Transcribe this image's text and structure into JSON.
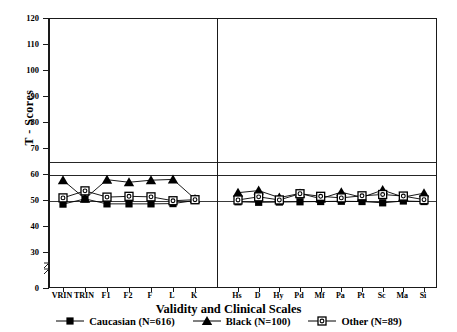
{
  "chart_data": {
    "type": "line",
    "title": "",
    "xlabel": "Validity and Clinical Scales",
    "ylabel": "T - Scores",
    "ylim": [
      0,
      120
    ],
    "yticks": [
      0,
      30,
      40,
      50,
      60,
      70,
      80,
      90,
      100,
      110,
      120
    ],
    "y_axis_break_between": [
      0,
      30
    ],
    "grid": false,
    "reference_lines": [
      65,
      60,
      50
    ],
    "group_divider_after_category": "K",
    "categories": [
      "VRIN",
      "TRIN",
      "F1",
      "F2",
      "F",
      "L",
      "K",
      "Hs",
      "D",
      "Hy",
      "Pd",
      "Mf",
      "Pa",
      "Pt",
      "Sc",
      "Ma",
      "Si"
    ],
    "category_groups": [
      {
        "name": "Validity Scales",
        "categories": [
          "VRIN",
          "TRIN",
          "F1",
          "F2",
          "F",
          "L",
          "K"
        ]
      },
      {
        "name": "Clinical Scales",
        "categories": [
          "Hs",
          "D",
          "Hy",
          "Pd",
          "Mf",
          "Pa",
          "Pt",
          "Sc",
          "Ma",
          "Si"
        ]
      }
    ],
    "legend_position": "bottom",
    "series": [
      {
        "name": "Caucasian (N=616)",
        "marker": "filled-square",
        "color": "#000000",
        "values": [
          48.8,
          50.8,
          48.9,
          48.9,
          48.9,
          49.0,
          50.2,
          49.7,
          49.5,
          49.6,
          49.7,
          49.8,
          49.9,
          49.8,
          49.3,
          50.0,
          49.8
        ]
      },
      {
        "name": "Black (N=100)",
        "marker": "filled-triangle",
        "color": "#000000",
        "values": [
          58.0,
          50.9,
          58.2,
          57.2,
          58.0,
          58.3,
          50.8,
          53.2,
          54.0,
          51.3,
          52.9,
          50.9,
          53.4,
          51.4,
          54.2,
          51.5,
          53.0
        ]
      },
      {
        "name": "Other (N=89)",
        "marker": "open-square",
        "color": "#000000",
        "values": [
          51.2,
          53.9,
          51.5,
          51.8,
          51.6,
          50.1,
          50.5,
          50.4,
          51.6,
          50.4,
          52.8,
          51.8,
          51.2,
          52.0,
          52.5,
          51.9,
          50.5
        ]
      }
    ]
  },
  "axis": {
    "y_title": "T - Scores",
    "x_title": "Validity and Clinical Scales"
  }
}
